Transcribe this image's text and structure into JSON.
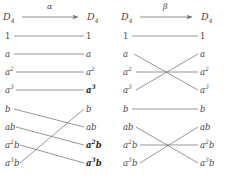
{
  "diagrams": [
    {
      "id": "alpha",
      "map_label": "α",
      "domain_label": "D",
      "domain_sub": "4",
      "codomain_label": "D",
      "codomain_sub": "4",
      "source_elements": [
        {
          "text": "1",
          "sup": "",
          "italic": false,
          "bold": false
        },
        {
          "text": "a",
          "sup": "",
          "italic": true,
          "bold": false
        },
        {
          "text": "a",
          "sup": "2",
          "italic": true,
          "bold": false
        },
        {
          "text": "a",
          "sup": "3",
          "italic": true,
          "bold": false
        },
        {
          "text": "b",
          "sup": "",
          "italic": true,
          "bold": false
        },
        {
          "text": "ab",
          "sup": "",
          "italic": true,
          "bold": false
        },
        {
          "text": "a",
          "sup": "2",
          "tail": "b",
          "italic": true,
          "bold": false
        },
        {
          "text": "a",
          "sup": "3",
          "tail": "b",
          "italic": true,
          "bold": false
        }
      ],
      "target_elements": [
        {
          "text": "1",
          "sup": "",
          "italic": false,
          "bold": false
        },
        {
          "text": "a",
          "sup": "",
          "italic": true,
          "bold": false
        },
        {
          "text": "a",
          "sup": "2",
          "italic": true,
          "bold": false
        },
        {
          "text": "a",
          "sup": "3",
          "italic": true,
          "bold": true
        },
        {
          "text": "b",
          "sup": "",
          "italic": true,
          "bold": false
        },
        {
          "text": "ab",
          "sup": "",
          "italic": true,
          "bold": false
        },
        {
          "text": "a",
          "sup": "2",
          "tail": "b",
          "italic": true,
          "bold": true
        },
        {
          "text": "a",
          "sup": "3",
          "tail": "b",
          "italic": true,
          "bold": true
        }
      ],
      "mapping": [
        0,
        1,
        2,
        3,
        5,
        6,
        7,
        4
      ]
    },
    {
      "id": "beta",
      "map_label": "β",
      "domain_label": "D",
      "domain_sub": "4",
      "codomain_label": "D",
      "codomain_sub": "4",
      "source_elements": [
        {
          "text": "1",
          "sup": "",
          "italic": false,
          "bold": false
        },
        {
          "text": "a",
          "sup": "",
          "italic": true,
          "bold": false
        },
        {
          "text": "a",
          "sup": "2",
          "italic": true,
          "bold": false
        },
        {
          "text": "a",
          "sup": "3",
          "italic": true,
          "bold": false
        },
        {
          "text": "b",
          "sup": "",
          "italic": true,
          "bold": false
        },
        {
          "text": "ab",
          "sup": "",
          "italic": true,
          "bold": false
        },
        {
          "text": "a",
          "sup": "2",
          "tail": "b",
          "italic": true,
          "bold": false
        },
        {
          "text": "a",
          "sup": "3",
          "tail": "b",
          "italic": true,
          "bold": false
        }
      ],
      "target_elements": [
        {
          "text": "1",
          "sup": "",
          "italic": false,
          "bold": false
        },
        {
          "text": "a",
          "sup": "",
          "italic": true,
          "bold": false
        },
        {
          "text": "a",
          "sup": "2",
          "italic": true,
          "bold": false
        },
        {
          "text": "a",
          "sup": "3",
          "italic": true,
          "bold": false
        },
        {
          "text": "b",
          "sup": "",
          "italic": true,
          "bold": false
        },
        {
          "text": "ab",
          "sup": "",
          "italic": true,
          "bold": false
        },
        {
          "text": "a",
          "sup": "2",
          "tail": "b",
          "italic": true,
          "bold": false
        },
        {
          "text": "a",
          "sup": "3",
          "tail": "b",
          "italic": true,
          "bold": false
        }
      ],
      "mapping": [
        0,
        3,
        2,
        1,
        4,
        7,
        6,
        5
      ]
    }
  ],
  "colors": {
    "ink": "#4a4745",
    "ink_bold": "#2b2926",
    "line": "#6f6c69",
    "background": "#ffffff"
  }
}
